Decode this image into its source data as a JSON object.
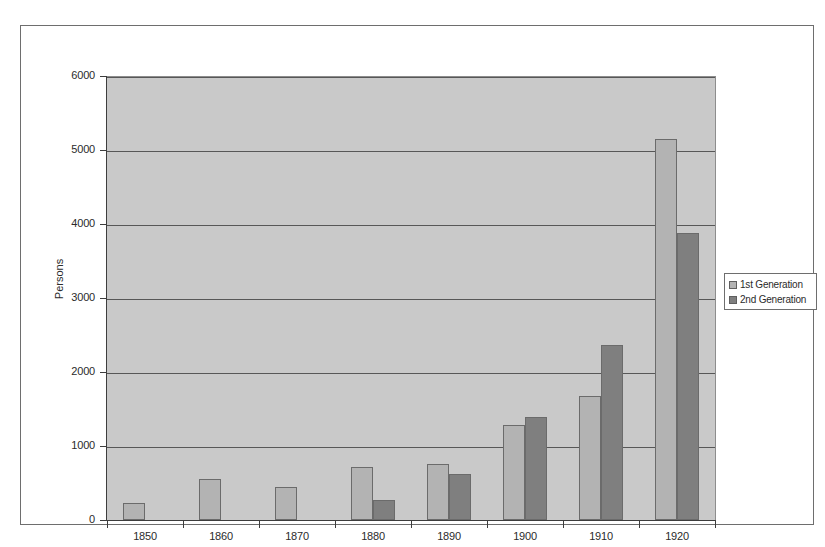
{
  "chart_data": {
    "type": "bar",
    "title": "",
    "subtitle": "",
    "xlabel": "",
    "ylabel": "Persons",
    "categories": [
      "1850",
      "1860",
      "1870",
      "1880",
      "1890",
      "1900",
      "1910",
      "1920"
    ],
    "series": [
      {
        "name": "1st Generation",
        "color": "#b3b3b3",
        "values": [
          230,
          550,
          440,
          710,
          760,
          1290,
          1680,
          5150
        ]
      },
      {
        "name": "2nd Generation",
        "color": "#7f7f7f",
        "values": [
          0,
          0,
          0,
          270,
          620,
          1390,
          2360,
          3880
        ]
      }
    ],
    "ylim": [
      0,
      6000
    ],
    "ytick_labels": [
      "0",
      "1000",
      "2000",
      "3000",
      "4000",
      "5000",
      "6000"
    ],
    "ytick_values": [
      0,
      1000,
      2000,
      3000,
      4000,
      5000,
      6000
    ],
    "grid": true,
    "grid_axis": "y",
    "legend_position": "right-outside",
    "legend_entries": [
      "1st Generation",
      "2nd Generation"
    ],
    "plot_background": "#c9c9c9",
    "figure_background": "#ffffff",
    "annotations": []
  }
}
